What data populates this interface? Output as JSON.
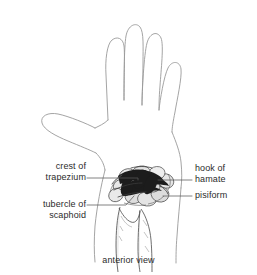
{
  "figure": {
    "caption": "anterior view",
    "background_color": "#ffffff",
    "outline_color": "#8c8c8c",
    "bone_line_color": "#4a4a4a",
    "bone_shade_color": "#1a1a1a",
    "leader_line_color": "#5a5a5a",
    "text_color": "#2b2b2b"
  },
  "labels": {
    "crest_of_trapezium": {
      "line1": "crest of",
      "line2": "trapezium",
      "side": "left"
    },
    "tubercle_of_scaphoid": {
      "line1": "tubercle of",
      "line2": "scaphoid",
      "side": "left"
    },
    "hook_of_hamate": {
      "line1": "hook of",
      "line2": "hamate",
      "side": "right"
    },
    "pisiform": {
      "line1": "pisiform",
      "side": "right"
    }
  }
}
